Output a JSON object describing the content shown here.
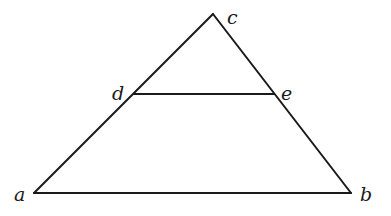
{
  "diagram": {
    "type": "triangle-with-parallel-segment",
    "points": {
      "a": {
        "label": "a",
        "x": 34,
        "y": 193,
        "label_x": 14,
        "label_y": 201
      },
      "b": {
        "label": "b",
        "x": 351,
        "y": 193,
        "label_x": 360,
        "label_y": 201
      },
      "c": {
        "label": "c",
        "x": 213,
        "y": 14,
        "label_x": 227,
        "label_y": 24
      },
      "d": {
        "label": "d",
        "x": 134,
        "y": 94,
        "label_x": 112,
        "label_y": 100
      },
      "e": {
        "label": "e",
        "x": 274,
        "y": 94,
        "label_x": 281,
        "label_y": 100
      }
    },
    "segments": [
      {
        "from": "a",
        "to": "c"
      },
      {
        "from": "c",
        "to": "b"
      },
      {
        "from": "a",
        "to": "b"
      },
      {
        "from": "d",
        "to": "e"
      }
    ]
  }
}
